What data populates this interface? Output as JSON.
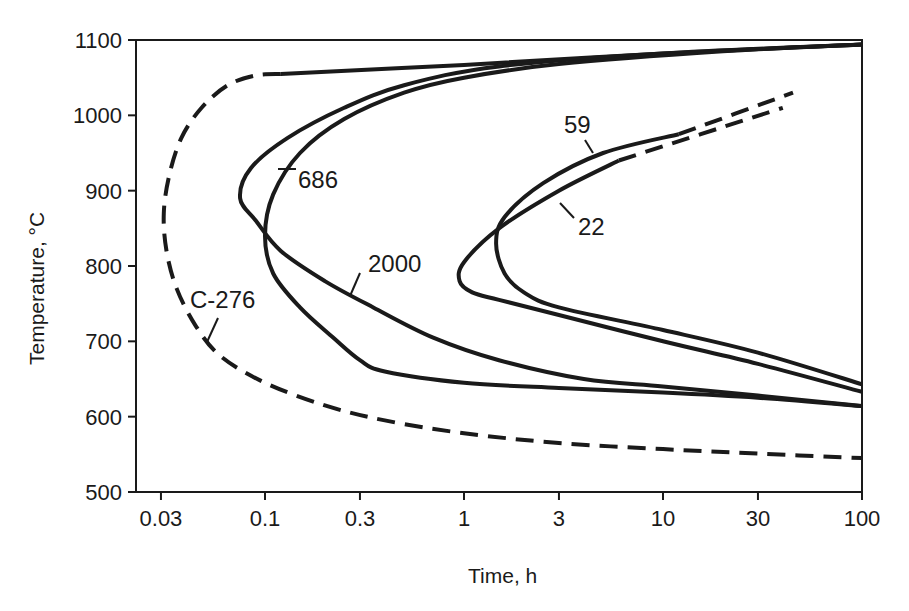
{
  "chart_data": {
    "type": "line",
    "title": "",
    "xlabel": "Time, h",
    "ylabel": "Temperature, °C",
    "xscale": "log",
    "xlim": [
      0.027,
      100
    ],
    "ylim": [
      500,
      1100
    ],
    "grid": false,
    "x_ticks": [
      0.03,
      0.1,
      0.3,
      1,
      3,
      10,
      30,
      100
    ],
    "x_tick_labels": [
      "0.03",
      "0.1",
      "0.3",
      "1",
      "3",
      "10",
      "30",
      "100"
    ],
    "y_ticks": [
      500,
      600,
      700,
      800,
      900,
      1000,
      1100
    ],
    "y_tick_labels": [
      "500",
      "600",
      "700",
      "800",
      "900",
      "1000",
      "1100"
    ],
    "series": [
      {
        "name": "C-276",
        "style": "dashed",
        "points": [
          [
            0.12,
            1055
          ],
          [
            0.09,
            1053
          ],
          [
            0.065,
            1040
          ],
          [
            0.048,
            1010
          ],
          [
            0.038,
            970
          ],
          [
            0.033,
            920
          ],
          [
            0.031,
            870
          ],
          [
            0.032,
            820
          ],
          [
            0.036,
            770
          ],
          [
            0.045,
            720
          ],
          [
            0.06,
            680
          ],
          [
            0.1,
            645
          ],
          [
            0.2,
            615
          ],
          [
            0.4,
            595
          ],
          [
            1,
            578
          ],
          [
            3,
            565
          ],
          [
            10,
            557
          ],
          [
            30,
            551
          ],
          [
            100,
            545
          ]
        ],
        "solid_segment": [
          [
            0.12,
            1055
          ],
          [
            1,
            1067
          ],
          [
            10,
            1082
          ],
          [
            100,
            1094
          ]
        ]
      },
      {
        "name": "2000",
        "style": "solid",
        "points": [
          [
            100,
            1094
          ],
          [
            10,
            1082
          ],
          [
            1.5,
            1065
          ],
          [
            0.5,
            1040
          ],
          [
            0.25,
            1010
          ],
          [
            0.13,
            970
          ],
          [
            0.085,
            930
          ],
          [
            0.075,
            890
          ],
          [
            0.09,
            860
          ],
          [
            0.12,
            820
          ],
          [
            0.2,
            780
          ],
          [
            0.35,
            745
          ],
          [
            0.7,
            705
          ],
          [
            1.5,
            675
          ],
          [
            4,
            650
          ],
          [
            10,
            640
          ],
          [
            30,
            628
          ],
          [
            100,
            614
          ]
        ]
      },
      {
        "name": "686",
        "style": "solid",
        "points": [
          [
            100,
            1094
          ],
          [
            20,
            1085
          ],
          [
            3,
            1068
          ],
          [
            1,
            1050
          ],
          [
            0.5,
            1030
          ],
          [
            0.25,
            995
          ],
          [
            0.15,
            950
          ],
          [
            0.11,
            895
          ],
          [
            0.1,
            840
          ],
          [
            0.11,
            790
          ],
          [
            0.15,
            745
          ],
          [
            0.22,
            705
          ],
          [
            0.3,
            675
          ],
          [
            0.4,
            660
          ],
          [
            1,
            645
          ],
          [
            3,
            638
          ],
          [
            10,
            632
          ],
          [
            30,
            625
          ],
          [
            100,
            614
          ]
        ]
      },
      {
        "name": "59",
        "style": "solid",
        "points": [
          [
            12,
            975
          ],
          [
            5,
            950
          ],
          [
            2.5,
            910
          ],
          [
            1.6,
            865
          ],
          [
            1.45,
            830
          ],
          [
            1.6,
            790
          ],
          [
            2,
            765
          ],
          [
            3,
            745
          ],
          [
            10,
            715
          ],
          [
            30,
            685
          ],
          [
            100,
            643
          ]
        ],
        "dashed_tail": [
          [
            12,
            975
          ],
          [
            45,
            1030
          ]
        ]
      },
      {
        "name": "22",
        "style": "solid",
        "points": [
          [
            6,
            940
          ],
          [
            3,
            900
          ],
          [
            1.5,
            850
          ],
          [
            1,
            805
          ],
          [
            0.95,
            780
          ],
          [
            1.1,
            765
          ],
          [
            1.5,
            755
          ],
          [
            3,
            735
          ],
          [
            10,
            700
          ],
          [
            30,
            670
          ],
          [
            100,
            633
          ]
        ],
        "dashed_tail": [
          [
            6,
            940
          ],
          [
            40,
            1010
          ]
        ]
      }
    ],
    "annotations": [
      {
        "text": "686",
        "x": 0.18,
        "y": 905
      },
      {
        "text": "2000",
        "x": 0.9,
        "y": 795
      },
      {
        "text": "59",
        "x": 2.5,
        "y": 990
      },
      {
        "text": "22",
        "x": 3.5,
        "y": 865
      },
      {
        "text": "C-276",
        "x": 0.045,
        "y": 750
      }
    ]
  },
  "labels": {
    "x_axis_title": "Time, h",
    "y_axis_title": "Temperature, °C",
    "curve_labels": {
      "c276": "C-276",
      "alloy2000": "2000",
      "alloy686": "686",
      "alloy59": "59",
      "alloy22": "22"
    }
  },
  "colors": {
    "ink": "#1a1a1a",
    "background": "#ffffff"
  }
}
